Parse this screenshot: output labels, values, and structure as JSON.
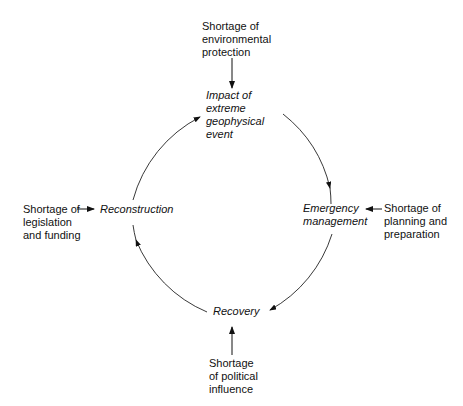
{
  "diagram": {
    "stages": {
      "impact": "Impact of\nextreme\ngeophysical\nevent",
      "emergency": "Emergency\nmanagement",
      "recovery": "Recovery",
      "reconstruction": "Reconstruction"
    },
    "shortages": {
      "top": "Shortage of\nenvironmental\nprotection",
      "right": "Shortage of\nplanning and\npreparation",
      "bottom": "Shortage\nof political\ninfluence",
      "left": "Shortage of\nlegislation\nand funding"
    }
  }
}
